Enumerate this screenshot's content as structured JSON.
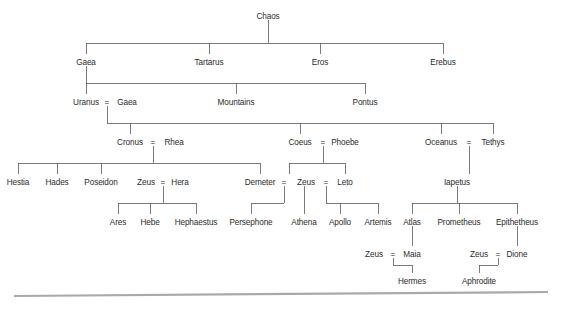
{
  "diagram": {
    "type": "genealogy-tree",
    "text_color": "#2b2b2b",
    "line_color": "#58595b",
    "rule_color": "#a7a9ac",
    "background": "#ffffff",
    "union_symbol": "=",
    "nodes": [
      {
        "id": "chaos",
        "label": "Chaos",
        "x": 268,
        "y": 16
      },
      {
        "id": "gaea1",
        "label": "Gaea",
        "x": 86,
        "y": 62
      },
      {
        "id": "tartarus",
        "label": "Tartarus",
        "x": 209,
        "y": 62
      },
      {
        "id": "eros",
        "label": "Eros",
        "x": 320,
        "y": 62
      },
      {
        "id": "erebus",
        "label": "Erebus",
        "x": 443,
        "y": 62
      },
      {
        "id": "uranus",
        "label": "Uranus",
        "x": 86,
        "y": 102
      },
      {
        "id": "gaea2",
        "label": "Gaea",
        "x": 127,
        "y": 102
      },
      {
        "id": "mountains",
        "label": "Mountains",
        "x": 236,
        "y": 102
      },
      {
        "id": "pontus",
        "label": "Pontus",
        "x": 365,
        "y": 102
      },
      {
        "id": "cronus",
        "label": "Cronus",
        "x": 130,
        "y": 142
      },
      {
        "id": "rhea",
        "label": "Rhea",
        "x": 174,
        "y": 142
      },
      {
        "id": "coeus",
        "label": "Coeus",
        "x": 300,
        "y": 142
      },
      {
        "id": "phoebe",
        "label": "Phoebe",
        "x": 345,
        "y": 142
      },
      {
        "id": "oceanus",
        "label": "Oceanus",
        "x": 441,
        "y": 142
      },
      {
        "id": "tethys",
        "label": "Tethys",
        "x": 493,
        "y": 142
      },
      {
        "id": "hestia",
        "label": "Hestia",
        "x": 18,
        "y": 182
      },
      {
        "id": "hades",
        "label": "Hades",
        "x": 57,
        "y": 182
      },
      {
        "id": "poseidon",
        "label": "Poseidon",
        "x": 101,
        "y": 182
      },
      {
        "id": "zeus1",
        "label": "Zeus",
        "x": 146,
        "y": 182
      },
      {
        "id": "hera",
        "label": "Hera",
        "x": 180,
        "y": 182
      },
      {
        "id": "demeter",
        "label": "Demeter",
        "x": 260,
        "y": 182
      },
      {
        "id": "zeus2",
        "label": "Zeus",
        "x": 306,
        "y": 182
      },
      {
        "id": "leto",
        "label": "Leto",
        "x": 345,
        "y": 182
      },
      {
        "id": "iapetus",
        "label": "Iapetus",
        "x": 457,
        "y": 182
      },
      {
        "id": "ares",
        "label": "Ares",
        "x": 118,
        "y": 222
      },
      {
        "id": "hebe",
        "label": "Hebe",
        "x": 150,
        "y": 222
      },
      {
        "id": "hephaestus",
        "label": "Hephaestus",
        "x": 196,
        "y": 222
      },
      {
        "id": "persephone",
        "label": "Persephone",
        "x": 251,
        "y": 222
      },
      {
        "id": "athena",
        "label": "Athena",
        "x": 304,
        "y": 222
      },
      {
        "id": "apollo",
        "label": "Apollo",
        "x": 340,
        "y": 222
      },
      {
        "id": "artemis",
        "label": "Artemis",
        "x": 378,
        "y": 222
      },
      {
        "id": "atlas",
        "label": "Atlas",
        "x": 412,
        "y": 222
      },
      {
        "id": "prometheus",
        "label": "Prometheus",
        "x": 459,
        "y": 222
      },
      {
        "id": "epitheteus",
        "label": "Epithetheus",
        "x": 517,
        "y": 222
      },
      {
        "id": "zeus3",
        "label": "Zeus",
        "x": 374,
        "y": 254
      },
      {
        "id": "maia",
        "label": "Maia",
        "x": 412,
        "y": 254
      },
      {
        "id": "zeus4",
        "label": "Zeus",
        "x": 479,
        "y": 254
      },
      {
        "id": "dione",
        "label": "Dione",
        "x": 517,
        "y": 254
      },
      {
        "id": "hermes",
        "label": "Hermes",
        "x": 412,
        "y": 281
      },
      {
        "id": "aphrodite",
        "label": "Aphrodite",
        "x": 479,
        "y": 281
      }
    ],
    "unions": [
      {
        "id": "uranus-gaea",
        "x": 107,
        "y": 102
      },
      {
        "id": "cronus-rhea",
        "x": 153,
        "y": 142
      },
      {
        "id": "coeus-phoebe",
        "x": 323,
        "y": 142
      },
      {
        "id": "oceanus-tethys",
        "x": 469,
        "y": 142
      },
      {
        "id": "zeus-hera",
        "x": 163,
        "y": 182
      },
      {
        "id": "demeter-zeus",
        "x": 284,
        "y": 182
      },
      {
        "id": "zeus-leto",
        "x": 326,
        "y": 182
      },
      {
        "id": "zeus-maia",
        "x": 393,
        "y": 254
      },
      {
        "id": "zeus-dione",
        "x": 498,
        "y": 254
      }
    ],
    "edges": [
      {
        "id": "chaos-children",
        "parent": "Chaos",
        "children": [
          "Gaea",
          "Tartarus",
          "Eros",
          "Erebus"
        ]
      },
      {
        "id": "gaea-children",
        "parent": "Gaea",
        "children": [
          "Uranus",
          "Mountains",
          "Pontus"
        ]
      },
      {
        "id": "uranus-gaea-children",
        "parent": "Uranus = Gaea",
        "children": [
          "Cronus",
          "Coeus",
          "Oceanus"
        ]
      },
      {
        "id": "cronus-rhea-children",
        "parent": "Cronus = Rhea",
        "children": [
          "Hestia",
          "Hades",
          "Poseidon",
          "Zeus",
          "Demeter"
        ]
      },
      {
        "id": "coeus-phoebe-children",
        "parent": "Coeus = Phoebe",
        "children": [
          "Zeus",
          "Leto"
        ]
      },
      {
        "id": "oceanus-tethys-children",
        "parent": "Oceanus = Tethys",
        "children": [
          "Iapetus"
        ]
      },
      {
        "id": "zeus-hera-children",
        "parent": "Zeus = Hera",
        "children": [
          "Ares",
          "Hebe",
          "Hephaestus"
        ]
      },
      {
        "id": "demeter-zeus-children",
        "parent": "Demeter = Zeus",
        "children": [
          "Persephone"
        ]
      },
      {
        "id": "zeus-athena",
        "parent": "Zeus",
        "children": [
          "Athena"
        ]
      },
      {
        "id": "zeus-leto-children",
        "parent": "Zeus = Leto",
        "children": [
          "Apollo",
          "Artemis"
        ]
      },
      {
        "id": "iapetus-children",
        "parent": "Iapetus",
        "children": [
          "Atlas",
          "Prometheus",
          "Epithetheus"
        ]
      },
      {
        "id": "atlas-zeus",
        "parent": "Atlas",
        "children": [
          "Maia"
        ]
      },
      {
        "id": "epitheteus-dione",
        "parent": "Epithetheus",
        "children": [
          "Dione"
        ]
      },
      {
        "id": "zeus-maia-children",
        "parent": "Zeus = Maia",
        "children": [
          "Hermes"
        ]
      },
      {
        "id": "zeus-dione-children",
        "parent": "Zeus = Dione",
        "children": [
          "Aphrodite"
        ]
      }
    ],
    "footer_rule": {
      "x1": 14,
      "y1": 296,
      "x2": 548,
      "y2": 292
    }
  }
}
